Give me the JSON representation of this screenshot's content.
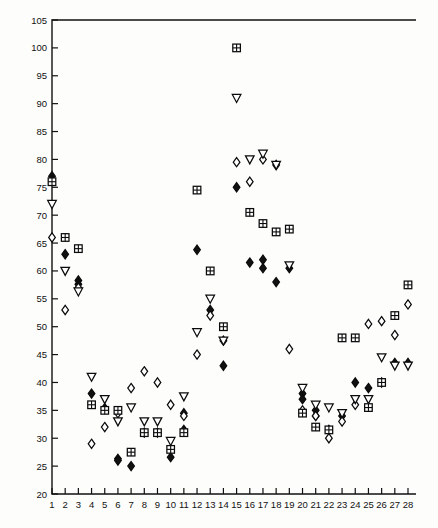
{
  "chart_data": {
    "type": "scatter",
    "title": "",
    "xlabel": "",
    "ylabel": "",
    "xlim": [
      0,
      28.6
    ],
    "ylim": [
      20,
      105
    ],
    "grid": false,
    "legend": "none",
    "xticks": [
      1,
      2,
      3,
      4,
      5,
      6,
      7,
      8,
      9,
      10,
      11,
      12,
      13,
      14,
      15,
      16,
      17,
      18,
      19,
      20,
      21,
      22,
      23,
      24,
      25,
      26,
      27,
      28
    ],
    "xticklabels": [
      "1",
      "2",
      "3",
      "4",
      "5",
      "6",
      "7",
      "8",
      "9",
      "10",
      "11",
      "12",
      "13",
      "14",
      "15",
      "16",
      "17",
      "18",
      "19",
      "20",
      "21",
      "22",
      "23",
      "24",
      "25",
      "26",
      "27",
      "28"
    ],
    "yticks": [
      20,
      25,
      30,
      35,
      40,
      45,
      50,
      55,
      60,
      65,
      70,
      75,
      80,
      85,
      90,
      95,
      100,
      105
    ],
    "yticklabels": [
      "20",
      "25",
      "30",
      "35",
      "40",
      "45",
      "50",
      "55",
      "60",
      "65",
      "70",
      "75",
      "80",
      "85",
      "90",
      "95",
      "100",
      "105"
    ],
    "series": [
      {
        "name": "filled-diamond",
        "marker": "filled-diamond",
        "color": "#111111",
        "points": [
          [
            1,
            77
          ],
          [
            1,
            76.3
          ],
          [
            2,
            63
          ],
          [
            3,
            58.3
          ],
          [
            3,
            57.6
          ],
          [
            4,
            38
          ],
          [
            5,
            35.4
          ],
          [
            6,
            26.3
          ],
          [
            6,
            26
          ],
          [
            7,
            25
          ],
          [
            8,
            31
          ],
          [
            9,
            31
          ],
          [
            10,
            26.6
          ],
          [
            11,
            31.5
          ],
          [
            11,
            34.5
          ],
          [
            12,
            63.8
          ],
          [
            13,
            53
          ],
          [
            14,
            43
          ],
          [
            15,
            75
          ],
          [
            16,
            61.5
          ],
          [
            17,
            62
          ],
          [
            17,
            60.5
          ],
          [
            18,
            58
          ],
          [
            19,
            60.5
          ],
          [
            20,
            38
          ],
          [
            20,
            37
          ],
          [
            21,
            35
          ],
          [
            21,
            34
          ],
          [
            22,
            31.5
          ],
          [
            23,
            34
          ],
          [
            24,
            40
          ],
          [
            25,
            39
          ],
          [
            26,
            40
          ],
          [
            27,
            43.5
          ],
          [
            28,
            43.5
          ]
        ]
      },
      {
        "name": "open-diamond",
        "marker": "open-diamond",
        "color": "#ffffff",
        "points": [
          [
            1,
            66
          ],
          [
            2,
            53
          ],
          [
            3,
            57
          ],
          [
            4,
            29
          ],
          [
            5,
            32
          ],
          [
            6,
            34.5
          ],
          [
            7,
            39
          ],
          [
            8,
            42
          ],
          [
            9,
            40
          ],
          [
            10,
            36
          ],
          [
            11,
            34
          ],
          [
            12,
            45
          ],
          [
            13,
            52
          ],
          [
            14,
            47.5
          ],
          [
            15,
            79.5
          ],
          [
            16,
            76
          ],
          [
            17,
            80
          ],
          [
            18,
            79
          ],
          [
            19,
            46
          ],
          [
            20,
            35
          ],
          [
            21,
            34
          ],
          [
            22,
            30
          ],
          [
            23,
            33
          ],
          [
            24,
            36
          ],
          [
            25,
            50.5
          ],
          [
            26,
            51
          ],
          [
            27,
            48.5
          ],
          [
            28,
            54
          ]
        ]
      },
      {
        "name": "triangle-down",
        "marker": "triangle-down",
        "color": "#ffffff",
        "points": [
          [
            1,
            72
          ],
          [
            2,
            60
          ],
          [
            3,
            56.3
          ],
          [
            4,
            41
          ],
          [
            5,
            37
          ],
          [
            6,
            33
          ],
          [
            7,
            35.5
          ],
          [
            8,
            33
          ],
          [
            9,
            33
          ],
          [
            10,
            29.5
          ],
          [
            11,
            37.5
          ],
          [
            12,
            49
          ],
          [
            13,
            55
          ],
          [
            14,
            47.5
          ],
          [
            15,
            91
          ],
          [
            16,
            80
          ],
          [
            17,
            81
          ],
          [
            18,
            79
          ],
          [
            19,
            61
          ],
          [
            20,
            39
          ],
          [
            21,
            36
          ],
          [
            22,
            35.5
          ],
          [
            23,
            34.5
          ],
          [
            24,
            37
          ],
          [
            25,
            37
          ],
          [
            26,
            44.5
          ],
          [
            27,
            43
          ],
          [
            28,
            43
          ]
        ]
      },
      {
        "name": "square-cross",
        "marker": "square-cross",
        "color": "#ffffff",
        "points": [
          [
            1,
            76
          ],
          [
            2,
            66
          ],
          [
            3,
            64
          ],
          [
            4,
            36
          ],
          [
            5,
            35
          ],
          [
            6,
            35
          ],
          [
            7,
            27.5
          ],
          [
            8,
            31
          ],
          [
            9,
            31
          ],
          [
            10,
            28
          ],
          [
            11,
            31
          ],
          [
            12,
            74.5
          ],
          [
            13,
            60
          ],
          [
            14,
            50
          ],
          [
            15,
            100
          ],
          [
            16,
            70.5
          ],
          [
            17,
            68.5
          ],
          [
            18,
            67
          ],
          [
            19,
            67.5
          ],
          [
            20,
            34.5
          ],
          [
            21,
            32
          ],
          [
            22,
            31.5
          ],
          [
            23,
            48
          ],
          [
            24,
            48
          ],
          [
            25,
            35.5
          ],
          [
            26,
            40
          ],
          [
            27,
            52
          ],
          [
            28,
            57.5
          ]
        ]
      }
    ]
  }
}
